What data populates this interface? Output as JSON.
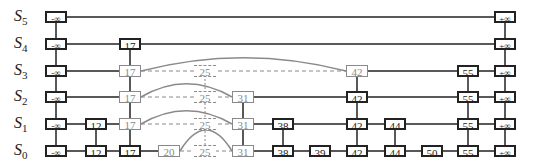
{
  "diagram": {
    "type": "skip-list-insertion",
    "levels": [
      {
        "name": "S",
        "sub": "5",
        "y": 17
      },
      {
        "name": "S",
        "sub": "4",
        "y": 44
      },
      {
        "name": "S",
        "sub": "3",
        "y": 71
      },
      {
        "name": "S",
        "sub": "2",
        "y": 97
      },
      {
        "name": "S",
        "sub": "1",
        "y": 124
      },
      {
        "name": "S",
        "sub": "0",
        "y": 151
      }
    ],
    "columns": [
      {
        "key": "neg_inf",
        "label": "-∞",
        "x": 56,
        "top_level": 5,
        "style": "normal"
      },
      {
        "key": "12",
        "label": "12",
        "x": 96,
        "top_level": 1,
        "style": "normal"
      },
      {
        "key": "17",
        "label": "17",
        "x": 130,
        "top_level": 4,
        "style": "normal",
        "gray_levels": [
          1,
          2,
          3
        ]
      },
      {
        "key": "20",
        "label": "20",
        "x": 169,
        "top_level": 0,
        "style": "gray"
      },
      {
        "key": "25",
        "label": "25",
        "x": 205,
        "top_level": 3,
        "style": "dashed"
      },
      {
        "key": "31",
        "label": "31",
        "x": 243,
        "top_level": 2,
        "style": "gray"
      },
      {
        "key": "38",
        "label": "38",
        "x": 283,
        "top_level": 1,
        "style": "normal"
      },
      {
        "key": "39",
        "label": "39",
        "x": 320,
        "top_level": 0,
        "style": "normal"
      },
      {
        "key": "42",
        "label": "42",
        "x": 357,
        "top_level": 3,
        "style": "normal",
        "gray_levels": [
          3
        ]
      },
      {
        "key": "44",
        "label": "44",
        "x": 395,
        "top_level": 1,
        "style": "normal"
      },
      {
        "key": "50",
        "label": "50",
        "x": 432,
        "top_level": 0,
        "style": "normal"
      },
      {
        "key": "55",
        "label": "55",
        "x": 468,
        "top_level": 3,
        "style": "normal"
      },
      {
        "key": "pos_inf",
        "label": "+∞",
        "x": 505,
        "top_level": 5,
        "style": "normal"
      }
    ],
    "colors": {
      "normal": "#222222",
      "gray": "#8a8a8a"
    }
  }
}
